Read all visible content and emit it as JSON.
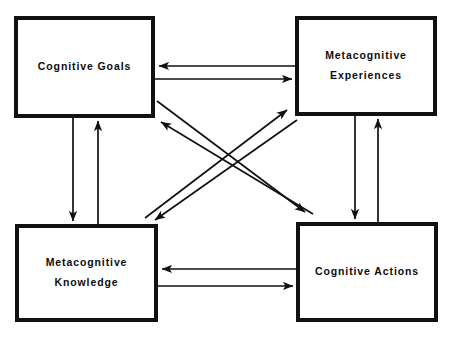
{
  "diagram": {
    "type": "node-link-diagram",
    "background_color": "#ffffff",
    "stroke_color": "#111111",
    "text_color": "#0d0d0d",
    "nodes": [
      {
        "id": "cognitive-goals",
        "lines": [
          "Cognitive Goals"
        ],
        "x": 14,
        "y": 16,
        "width": 141,
        "height": 102
      },
      {
        "id": "metacognitive-experiences",
        "lines": [
          "Metacognitive",
          "Experiences"
        ],
        "x": 295,
        "y": 16,
        "width": 142,
        "height": 100
      },
      {
        "id": "metacognitive-knowledge",
        "lines": [
          "Metacognitive",
          "Knowledge"
        ],
        "x": 15,
        "y": 224,
        "width": 143,
        "height": 98
      },
      {
        "id": "cognitive-actions",
        "lines": [
          "Cognitive Actions"
        ],
        "x": 296,
        "y": 222,
        "width": 142,
        "height": 100
      }
    ],
    "edges": [
      {
        "id": "exp-to-goals",
        "from": "metacognitive-experiences",
        "to": "cognitive-goals",
        "orientation": "horizontal",
        "direction": "left"
      },
      {
        "id": "goals-to-exp",
        "from": "cognitive-goals",
        "to": "metacognitive-experiences",
        "orientation": "horizontal",
        "direction": "right"
      },
      {
        "id": "act-to-know",
        "from": "cognitive-actions",
        "to": "metacognitive-knowledge",
        "orientation": "horizontal",
        "direction": "left"
      },
      {
        "id": "know-to-act",
        "from": "metacognitive-knowledge",
        "to": "cognitive-actions",
        "orientation": "horizontal",
        "direction": "right"
      },
      {
        "id": "goals-to-know",
        "from": "cognitive-goals",
        "to": "metacognitive-knowledge",
        "orientation": "vertical",
        "direction": "down"
      },
      {
        "id": "know-to-goals",
        "from": "metacognitive-knowledge",
        "to": "cognitive-goals",
        "orientation": "vertical",
        "direction": "up"
      },
      {
        "id": "exp-to-act",
        "from": "metacognitive-experiences",
        "to": "cognitive-actions",
        "orientation": "vertical",
        "direction": "down"
      },
      {
        "id": "act-to-exp",
        "from": "cognitive-actions",
        "to": "metacognitive-experiences",
        "orientation": "vertical",
        "direction": "up"
      },
      {
        "id": "goals-to-act",
        "from": "cognitive-goals",
        "to": "cognitive-actions",
        "orientation": "diagonal",
        "direction": "down-right"
      },
      {
        "id": "act-to-goals",
        "from": "cognitive-actions",
        "to": "cognitive-goals",
        "orientation": "diagonal",
        "direction": "up-left"
      },
      {
        "id": "know-to-exp",
        "from": "metacognitive-knowledge",
        "to": "metacognitive-experiences",
        "orientation": "diagonal",
        "direction": "up-right"
      },
      {
        "id": "exp-to-know",
        "from": "metacognitive-experiences",
        "to": "metacognitive-knowledge",
        "orientation": "diagonal",
        "direction": "down-left"
      }
    ]
  }
}
